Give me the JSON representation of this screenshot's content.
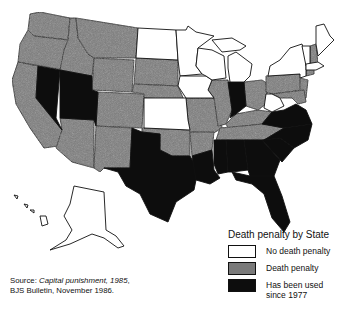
{
  "colors": {
    "no_death_penalty": "#ffffff",
    "death_penalty": "#7a7a7a",
    "used_since_1977": "#0d0d0d",
    "border": "#111111"
  },
  "legend": {
    "title": "Death penalty by State",
    "items": [
      {
        "key": "no_death_penalty",
        "label": "No death penalty"
      },
      {
        "key": "death_penalty",
        "label": "Death penalty"
      },
      {
        "key": "used_since_1977",
        "label": "Has been used since 1977",
        "line1": "Has been used",
        "line2": "since 1977"
      }
    ]
  },
  "source": {
    "prefix": "Source: ",
    "title": "Capital punishment, 1985",
    "suffix": ",",
    "line2": "BJS Bulletin, November 1986."
  },
  "map_regions": {
    "no_death_penalty": [
      "North Dakota",
      "Minnesota",
      "Iowa",
      "Wisconsin",
      "Michigan",
      "Kansas",
      "West Virginia",
      "New York",
      "Maine",
      "Vermont",
      "Massachusetts",
      "Rhode Island",
      "Alaska",
      "Hawaii"
    ],
    "death_penalty": [
      "Washington",
      "Oregon",
      "California",
      "Idaho",
      "Montana",
      "Wyoming",
      "Colorado",
      "Arizona",
      "New Mexico",
      "South Dakota",
      "Nebraska",
      "Oklahoma",
      "Missouri",
      "Illinois",
      "Arkansas",
      "Kentucky",
      "Tennessee",
      "Ohio",
      "Pennsylvania",
      "New Jersey",
      "Delaware",
      "Maryland",
      "Connecticut",
      "New Hampshire"
    ],
    "used_since_1977": [
      "Nevada",
      "Utah",
      "Texas",
      "Louisiana",
      "Mississippi",
      "Alabama",
      "Georgia",
      "Florida",
      "South Carolina",
      "North Carolina",
      "Virginia",
      "Indiana"
    ]
  }
}
